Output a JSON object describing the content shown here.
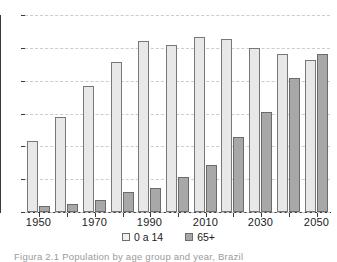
{
  "chart_data": {
    "type": "bar",
    "title": "",
    "subtitle": "",
    "xlabel": "",
    "ylabel": "",
    "grid": true,
    "legend_position": "bottom-center",
    "axis": {
      "y_ticks_count": 7,
      "y_tick_labels": [],
      "x_tick_labels_shown": [
        "1950",
        "1970",
        "1990",
        "2010",
        "2030",
        "2050"
      ]
    },
    "categories": [
      "1950",
      "1960",
      "1970",
      "1980",
      "1990",
      "2000",
      "2010",
      "2020",
      "2030",
      "2040",
      "2050"
    ],
    "series": [
      {
        "name": "0 a 14",
        "color": "#e8e8e8",
        "values": [
          36,
          48,
          64,
          76,
          87,
          85,
          89,
          88,
          83,
          80,
          77
        ]
      },
      {
        "name": "65+",
        "color": "#a8a8a8",
        "values": [
          3,
          4,
          6,
          10,
          12,
          18,
          24,
          38,
          51,
          68,
          80
        ]
      }
    ]
  },
  "legend": {
    "entries": [
      {
        "label": "0 a 14",
        "swatch": "young"
      },
      {
        "label": "65+",
        "swatch": "old"
      }
    ]
  },
  "caption": {
    "text": "Figura 2.1 Population by age group and year, Brazil"
  }
}
